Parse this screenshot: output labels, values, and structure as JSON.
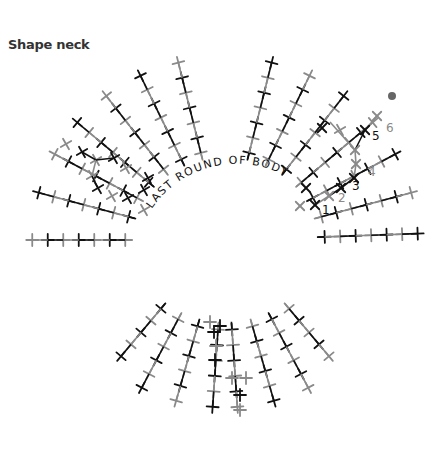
{
  "title": "Shape neck",
  "center_label": "LAST ROUND OF BODY",
  "colors": {
    "dark": "#111111",
    "light": "#8a8a8a",
    "dot": "#666666",
    "title": "#333333"
  },
  "row_numbers": [
    {
      "label": "1",
      "x": 322,
      "y": 214,
      "color": "dark"
    },
    {
      "label": "2",
      "x": 338,
      "y": 202,
      "color": "light"
    },
    {
      "label": "3",
      "x": 352,
      "y": 190,
      "color": "dark"
    },
    {
      "label": "4",
      "x": 368,
      "y": 176,
      "color": "light"
    },
    {
      "label": "5",
      "x": 372,
      "y": 140,
      "color": "dark"
    },
    {
      "label": "6",
      "x": 386,
      "y": 132,
      "color": "light"
    }
  ],
  "end_marker": {
    "shape": "dot",
    "x": 392,
    "y": 96
  },
  "symbol": "single-crochet-cross",
  "rays": [
    {
      "angle": 180,
      "count": 7
    },
    {
      "angle": 165,
      "count": 7
    },
    {
      "angle": 152,
      "count": 7
    },
    {
      "angle": 140,
      "count": 7
    },
    {
      "angle": 128,
      "count": 7
    },
    {
      "angle": 116,
      "count": 7
    },
    {
      "angle": 104,
      "count": 7
    },
    {
      "angle": 76,
      "count": 7
    },
    {
      "angle": 64,
      "count": 7
    },
    {
      "angle": 52,
      "count": 7
    },
    {
      "angle": 40,
      "count": 7
    },
    {
      "angle": 28,
      "count": 7
    },
    {
      "angle": 15,
      "count": 7
    },
    {
      "angle": 2,
      "count": 7
    },
    {
      "angle": -50,
      "count": 5
    },
    {
      "angle": -62,
      "count": 6
    },
    {
      "angle": -74,
      "count": 6
    },
    {
      "angle": -86,
      "count": 6
    },
    {
      "angle": -94,
      "count": 6
    },
    {
      "angle": -106,
      "count": 6
    },
    {
      "angle": -118,
      "count": 6
    },
    {
      "angle": -130,
      "count": 5
    }
  ]
}
